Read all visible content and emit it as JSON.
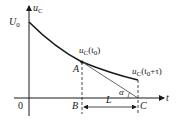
{
  "diagram": {
    "title": "",
    "axes": {
      "y_label": "u",
      "y_label_sub": "C",
      "x_label": "t",
      "origin_label": "0"
    },
    "labels": {
      "u0": "U",
      "u0_sub": "0",
      "point_a": "A",
      "point_b": "B",
      "point_c": "C",
      "uc_t0_main": "u",
      "uc_t0_sub": "C",
      "uc_t0_arg": "(t",
      "uc_t0_arg_sub": "0",
      "uc_t0_close": ")",
      "uc_t0tau_main": "u",
      "uc_t0tau_sub": "C",
      "uc_t0tau_arg": "(t",
      "uc_t0tau_arg_sub": "0",
      "uc_t0tau_close": "+τ)",
      "length": "L",
      "angle": "α"
    },
    "colors": {
      "stroke": "#1a1a1a",
      "tangent": "#555555",
      "background": "#ffffff"
    }
  }
}
